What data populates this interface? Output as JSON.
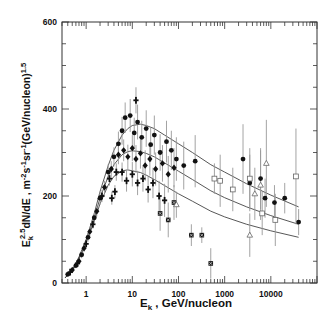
{
  "chart_data": {
    "type": "scatter",
    "title": "",
    "xlabel": "E_k , GeV/nucleon",
    "xlabel_main": "E",
    "xlabel_sub": "k",
    "xlabel_rest": " , GeV/nucleon",
    "ylabel": "E_k^2.5 dN/dE , m^-2 s^-1 sr^-1 (GeV/nucleon)^1.5",
    "xscale": "log",
    "xlim": [
      0.3,
      100000
    ],
    "ylim": [
      0,
      600
    ],
    "grid": false,
    "legend": null,
    "x_ticks": [
      {
        "value": 1,
        "label": "1"
      },
      {
        "value": 10,
        "label": "10"
      },
      {
        "value": 100,
        "label": "100"
      },
      {
        "value": 1000,
        "label": "1000"
      },
      {
        "value": 10000,
        "label": "10000"
      }
    ],
    "y_ticks": [
      {
        "value": 0,
        "label": "0"
      },
      {
        "value": 200,
        "label": "200"
      },
      {
        "value": 400,
        "label": "400"
      },
      {
        "value": 600,
        "label": "600"
      }
    ],
    "y_minor_step": 50,
    "model_curves": [
      {
        "name": "upper",
        "x": [
          0.35,
          0.5,
          0.7,
          1,
          1.5,
          2,
          3,
          4,
          6,
          8,
          10,
          15,
          20,
          30,
          50,
          100,
          200,
          500,
          1000,
          3000,
          10000,
          40000
        ],
        "y": [
          12,
          30,
          60,
          100,
          160,
          210,
          270,
          305,
          340,
          355,
          362,
          365,
          362,
          355,
          340,
          320,
          300,
          272,
          255,
          228,
          202,
          175
        ]
      },
      {
        "name": "middle",
        "x": [
          0.35,
          0.5,
          0.7,
          1,
          1.5,
          2,
          3,
          4,
          6,
          8,
          10,
          15,
          20,
          30,
          50,
          100,
          200,
          500,
          1000,
          3000,
          10000,
          40000
        ],
        "y": [
          12,
          28,
          58,
          96,
          150,
          195,
          245,
          272,
          295,
          302,
          304,
          302,
          298,
          290,
          276,
          257,
          238,
          212,
          196,
          175,
          155,
          135
        ]
      },
      {
        "name": "lower",
        "x": [
          0.35,
          0.5,
          0.7,
          1,
          1.5,
          2,
          3,
          4,
          6,
          8,
          10,
          15,
          20,
          30,
          50,
          100,
          200,
          500,
          1000,
          3000,
          10000,
          40000
        ],
        "y": [
          12,
          27,
          55,
          92,
          142,
          182,
          225,
          245,
          258,
          260,
          258,
          254,
          248,
          238,
          224,
          205,
          188,
          165,
          152,
          135,
          120,
          105
        ]
      }
    ],
    "series": [
      {
        "name": "filled circles",
        "marker": "circle-filled",
        "points": [
          {
            "x": 0.4,
            "y": 20,
            "err": 5
          },
          {
            "x": 0.6,
            "y": 40,
            "err": 6
          },
          {
            "x": 0.8,
            "y": 65,
            "err": 8
          },
          {
            "x": 1.1,
            "y": 105,
            "err": 10
          },
          {
            "x": 1.5,
            "y": 150,
            "err": 12
          },
          {
            "x": 2,
            "y": 195,
            "err": 15
          },
          {
            "x": 3,
            "y": 255,
            "err": 18
          },
          {
            "x": 4,
            "y": 290,
            "err": 22
          },
          {
            "x": 5,
            "y": 320,
            "err": 28
          },
          {
            "x": 6,
            "y": 350,
            "err": 32
          },
          {
            "x": 7,
            "y": 380,
            "err": 35
          },
          {
            "x": 9,
            "y": 385,
            "err": 38
          },
          {
            "x": 11,
            "y": 345,
            "err": 35
          },
          {
            "x": 13,
            "y": 370,
            "err": 40
          },
          {
            "x": 16,
            "y": 335,
            "err": 38
          },
          {
            "x": 20,
            "y": 355,
            "err": 42
          },
          {
            "x": 25,
            "y": 318,
            "err": 40
          },
          {
            "x": 30,
            "y": 340,
            "err": 45
          },
          {
            "x": 40,
            "y": 300,
            "err": 42
          },
          {
            "x": 55,
            "y": 325,
            "err": 48
          },
          {
            "x": 70,
            "y": 305,
            "err": 45
          },
          {
            "x": 90,
            "y": 285,
            "err": 50
          },
          {
            "x": 130,
            "y": 270,
            "err": 55
          },
          {
            "x": 230,
            "y": 280,
            "err": 60
          },
          {
            "x": 2500,
            "y": 285,
            "err": 80
          },
          {
            "x": 3500,
            "y": 230,
            "err": 65
          },
          {
            "x": 6000,
            "y": 240,
            "err": 70
          },
          {
            "x": 7500,
            "y": 195,
            "err": 45
          },
          {
            "x": 12000,
            "y": 185,
            "err": 40
          },
          {
            "x": 20000,
            "y": 195,
            "err": 35
          },
          {
            "x": 40000,
            "y": 140,
            "err": 30
          }
        ]
      },
      {
        "name": "filled diamonds",
        "marker": "diamond-filled",
        "points": [
          {
            "x": 0.5,
            "y": 30,
            "err": 5
          },
          {
            "x": 0.7,
            "y": 50,
            "err": 6
          },
          {
            "x": 0.9,
            "y": 80,
            "err": 8
          },
          {
            "x": 1.2,
            "y": 118,
            "err": 10
          },
          {
            "x": 1.7,
            "y": 165,
            "err": 12
          },
          {
            "x": 2.5,
            "y": 220,
            "err": 15
          },
          {
            "x": 3.5,
            "y": 262,
            "err": 18
          },
          {
            "x": 5,
            "y": 295,
            "err": 22
          },
          {
            "x": 6.5,
            "y": 305,
            "err": 25
          },
          {
            "x": 8,
            "y": 290,
            "err": 28
          },
          {
            "x": 10,
            "y": 310,
            "err": 30
          },
          {
            "x": 12,
            "y": 285,
            "err": 32
          },
          {
            "x": 15,
            "y": 298,
            "err": 35
          },
          {
            "x": 19,
            "y": 270,
            "err": 35
          },
          {
            "x": 24,
            "y": 285,
            "err": 38
          },
          {
            "x": 32,
            "y": 262,
            "err": 38
          },
          {
            "x": 45,
            "y": 275,
            "err": 42
          },
          {
            "x": 60,
            "y": 250,
            "err": 42
          },
          {
            "x": 80,
            "y": 265,
            "err": 45
          }
        ]
      },
      {
        "name": "filled crosses",
        "marker": "cross-filled",
        "points": [
          {
            "x": 0.45,
            "y": 25,
            "err": 5
          },
          {
            "x": 0.65,
            "y": 45,
            "err": 6
          },
          {
            "x": 1,
            "y": 90,
            "err": 8
          },
          {
            "x": 1.4,
            "y": 135,
            "err": 10
          },
          {
            "x": 2.2,
            "y": 200,
            "err": 14
          },
          {
            "x": 3.2,
            "y": 240,
            "err": 16
          },
          {
            "x": 4.5,
            "y": 255,
            "err": 20
          },
          {
            "x": 3.6,
            "y": 195,
            "err": 15
          },
          {
            "x": 4.2,
            "y": 210,
            "err": 15
          },
          {
            "x": 6,
            "y": 255,
            "err": 22
          },
          {
            "x": 7.5,
            "y": 235,
            "err": 25
          },
          {
            "x": 10,
            "y": 250,
            "err": 28
          },
          {
            "x": 13,
            "y": 230,
            "err": 28
          },
          {
            "x": 17,
            "y": 240,
            "err": 30
          },
          {
            "x": 22,
            "y": 215,
            "err": 30
          },
          {
            "x": 28,
            "y": 230,
            "err": 35
          },
          {
            "x": 38,
            "y": 200,
            "err": 35
          },
          {
            "x": 50,
            "y": 190,
            "err": 38
          },
          {
            "x": 12,
            "y": 420,
            "err": 30
          }
        ]
      },
      {
        "name": "filled squares (bowtie)",
        "marker": "bowtie-filled",
        "points": [
          {
            "x": 40,
            "y": 160,
            "err": 40
          },
          {
            "x": 60,
            "y": 145,
            "err": 40
          },
          {
            "x": 80,
            "y": 185,
            "err": 40
          },
          {
            "x": 190,
            "y": 110,
            "err": 25
          },
          {
            "x": 320,
            "y": 110,
            "err": 18
          },
          {
            "x": 500,
            "y": 45,
            "err": 35
          }
        ]
      },
      {
        "name": "open squares",
        "marker": "square-open",
        "points": [
          {
            "x": 600,
            "y": 240,
            "err": 35
          },
          {
            "x": 800,
            "y": 235,
            "err": 60
          },
          {
            "x": 1500,
            "y": 215,
            "err": 50
          },
          {
            "x": 3500,
            "y": 240,
            "err": 70
          },
          {
            "x": 6500,
            "y": 160,
            "err": 50
          },
          {
            "x": 12500,
            "y": 145,
            "err": 60
          },
          {
            "x": 35000,
            "y": 245,
            "err": 110
          }
        ]
      },
      {
        "name": "open triangles",
        "marker": "triangle-open",
        "points": [
          {
            "x": 90,
            "y": 180,
            "err": 30
          },
          {
            "x": 3500,
            "y": 110,
            "err": 50
          },
          {
            "x": 4500,
            "y": 205,
            "err": 60
          },
          {
            "x": 6000,
            "y": 225,
            "err": 80
          },
          {
            "x": 8000,
            "y": 275,
            "err": 100
          }
        ]
      }
    ]
  }
}
